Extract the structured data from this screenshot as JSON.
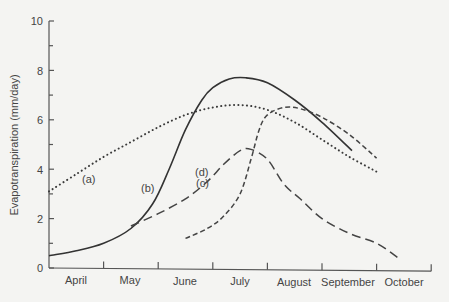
{
  "chart_data": {
    "type": "line",
    "title": "",
    "xlabel": "",
    "ylabel": "Evapotranspiration (mm/day)",
    "ylim": [
      0,
      10
    ],
    "yticks": [
      0,
      2,
      4,
      6,
      8,
      10
    ],
    "yminor_ticks": [
      1,
      3,
      5,
      7,
      9
    ],
    "x_unit": "months from start of April",
    "xlim": [
      0,
      7
    ],
    "categories": [
      "April",
      "May",
      "June",
      "July",
      "August",
      "September",
      "October"
    ],
    "grid": false,
    "legend": "inline labels (a)-(d)",
    "series": [
      {
        "name": "(a)",
        "style": "dotted",
        "x": [
          0.0,
          0.5,
          1.0,
          1.5,
          2.0,
          2.5,
          3.0,
          3.5,
          4.0,
          4.5,
          5.0,
          5.5,
          6.0
        ],
        "values": [
          3.1,
          3.8,
          4.5,
          5.1,
          5.7,
          6.2,
          6.5,
          6.6,
          6.4,
          5.9,
          5.2,
          4.5,
          3.9
        ]
      },
      {
        "name": "(b)",
        "style": "solid",
        "x": [
          0.0,
          0.5,
          1.0,
          1.5,
          1.9,
          2.2,
          2.5,
          2.8,
          3.0,
          3.3,
          3.6,
          4.0,
          4.5,
          5.0,
          5.55
        ],
        "values": [
          0.5,
          0.7,
          1.0,
          1.6,
          2.6,
          4.0,
          5.6,
          6.8,
          7.3,
          7.65,
          7.7,
          7.5,
          6.8,
          5.9,
          4.75
        ]
      },
      {
        "name": "(c)",
        "style": "short-dashed",
        "x": [
          2.5,
          2.9,
          3.2,
          3.5,
          3.7,
          3.85,
          4.0,
          4.3,
          4.6,
          5.0,
          5.5,
          6.0
        ],
        "values": [
          1.2,
          1.6,
          2.1,
          3.0,
          4.4,
          5.6,
          6.2,
          6.5,
          6.45,
          6.1,
          5.4,
          4.45
        ]
      },
      {
        "name": "(d)",
        "style": "long-dashed",
        "x": [
          1.5,
          2.0,
          2.5,
          2.9,
          3.2,
          3.5,
          3.7,
          4.0,
          4.3,
          4.6,
          5.0,
          5.5,
          6.0,
          6.4
        ],
        "values": [
          1.7,
          2.2,
          2.8,
          3.5,
          4.2,
          4.75,
          4.8,
          4.4,
          3.4,
          2.8,
          2.0,
          1.4,
          1.0,
          0.4
        ]
      }
    ],
    "annotations": [
      {
        "text": "(a)",
        "x": 0.75,
        "value": 4.6
      },
      {
        "text": "(b)",
        "x": 1.85,
        "value": 3.4
      },
      {
        "text": "(c)",
        "x": 2.85,
        "value": 3.1
      },
      {
        "text": "(d)",
        "x": 2.75,
        "value": 3.9
      }
    ]
  },
  "axis": {
    "y_title": "Evapotranspiration (mm/day)",
    "y_tick_labels": [
      "0",
      "2",
      "4",
      "6",
      "8",
      "10"
    ],
    "x_month_labels": [
      "April",
      "May",
      "June",
      "July",
      "August",
      "September",
      "October"
    ]
  },
  "labels": {
    "a": "(a)",
    "b": "(b)",
    "c": "(c)",
    "d": "(d)"
  }
}
